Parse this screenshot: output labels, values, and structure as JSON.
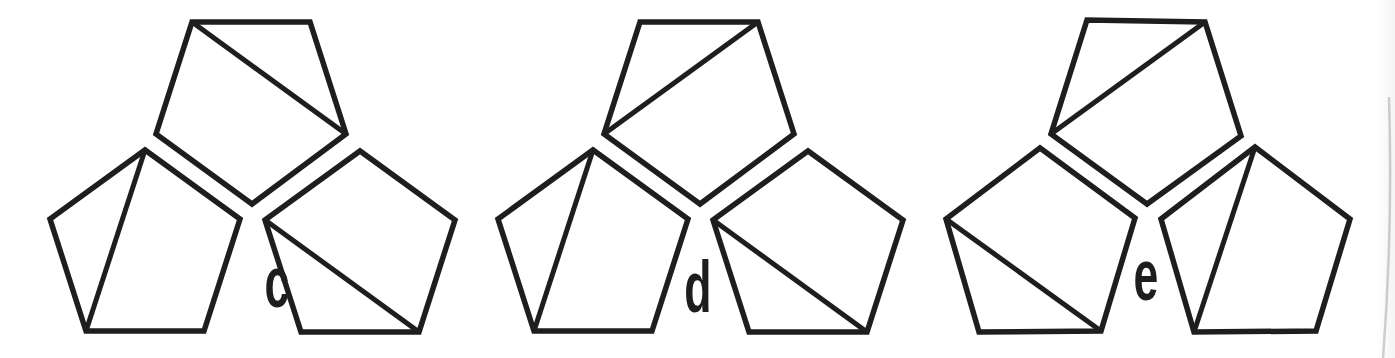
{
  "figure": {
    "background": "#ffffff",
    "stroke_color": "#1e1e1e",
    "stroke_width": 5.5,
    "diagonal_stroke_width": 5,
    "label_color": "#1e1e1e",
    "canvas": {
      "width": 1395,
      "height": 358
    },
    "groups": [
      {
        "label": "c",
        "label_x": 277,
        "label_baseline_y": 307,
        "pentagons": [
          {
            "name": "top",
            "points": [
              [
                252,
                204
              ],
              [
                156,
                134
              ],
              [
                192,
                22
              ],
              [
                310,
                22
              ],
              [
                346,
                134
              ]
            ],
            "diagonal": [
              [
                192,
                22
              ],
              [
                346,
                134
              ]
            ]
          },
          {
            "name": "lower-left",
            "points": [
              [
                240,
                219
              ],
              [
                204,
                331
              ],
              [
                86,
                331
              ],
              [
                50,
                219
              ],
              [
                145,
                150
              ]
            ],
            "diagonal": [
              [
                145,
                150
              ],
              [
                86,
                331
              ]
            ]
          },
          {
            "name": "lower-right",
            "points": [
              [
                265,
                220
              ],
              [
                360,
                151
              ],
              [
                455,
                220
              ],
              [
                419,
                332
              ],
              [
                301,
                332
              ]
            ],
            "diagonal": [
              [
                265,
                220
              ],
              [
                419,
                332
              ]
            ]
          }
        ]
      },
      {
        "label": "d",
        "label_x": 698,
        "label_baseline_y": 312,
        "pentagons": [
          {
            "name": "top",
            "points": [
              [
                700,
                204
              ],
              [
                604,
                134
              ],
              [
                640,
                22
              ],
              [
                758,
                22
              ],
              [
                794,
                134
              ]
            ],
            "diagonal": [
              [
                758,
                22
              ],
              [
                604,
                134
              ]
            ]
          },
          {
            "name": "lower-left",
            "points": [
              [
                688,
                219
              ],
              [
                652,
                331
              ],
              [
                534,
                331
              ],
              [
                498,
                219
              ],
              [
                593,
                150
              ]
            ],
            "diagonal": [
              [
                593,
                150
              ],
              [
                534,
                331
              ]
            ]
          },
          {
            "name": "lower-right",
            "points": [
              [
                713,
                220
              ],
              [
                808,
                151
              ],
              [
                903,
                220
              ],
              [
                867,
                332
              ],
              [
                749,
                332
              ]
            ],
            "diagonal": [
              [
                713,
                220
              ],
              [
                867,
                332
              ]
            ]
          }
        ]
      },
      {
        "label": "e",
        "label_x": 1146,
        "label_baseline_y": 300,
        "pentagons": [
          {
            "name": "top",
            "points": [
              [
                1147,
                204
              ],
              [
                1051,
                134
              ],
              [
                1087,
                20
              ],
              [
                1205,
                22
              ],
              [
                1241,
                136
              ]
            ],
            "diagonal": [
              [
                1205,
                22
              ],
              [
                1051,
                134
              ]
            ]
          },
          {
            "name": "lower-left",
            "points": [
              [
                1135,
                218
              ],
              [
                1101,
                331
              ],
              [
                979,
                332
              ],
              [
                946,
                219
              ],
              [
                1040,
                148
              ]
            ],
            "diagonal": [
              [
                946,
                219
              ],
              [
                1101,
                331
              ]
            ]
          },
          {
            "name": "lower-right",
            "points": [
              [
                1161,
                219
              ],
              [
                1255,
                147
              ],
              [
                1350,
                219
              ],
              [
                1316,
                331
              ],
              [
                1194,
                332
              ]
            ],
            "diagonal": [
              [
                1255,
                147
              ],
              [
                1194,
                332
              ]
            ]
          }
        ]
      }
    ],
    "scan_edge": {
      "path": "M 1389 97 Q 1393 230 1383 358",
      "color": "#c6c6c6",
      "width": 2.5
    }
  }
}
